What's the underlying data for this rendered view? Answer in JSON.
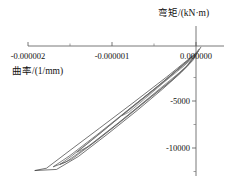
{
  "chart_data": {
    "type": "line",
    "title": "",
    "subtitle": "",
    "xlabel": "曲率/(1/mm)",
    "ylabel": "弯矩/(kN·m)",
    "xlim": [
      -2.3e-06,
      1.2e-07
    ],
    "ylim": [
      -12500,
      1200
    ],
    "grid": false,
    "legend": null,
    "xticks": [
      -2e-06,
      -1e-06,
      0.0
    ],
    "xticklabels": [
      "-0.000002",
      "-0.000001",
      "0.000000"
    ],
    "yticks": [
      -5000,
      -10000
    ],
    "yticklabels": [
      "-5000",
      "-10000"
    ],
    "annotations": [],
    "series": [
      {
        "name": "loop-1-outer",
        "color": "#3a3a3a",
        "points": [
          [
            4e-08,
            520
          ],
          [
            -2e-08,
            -60
          ],
          [
            -3.5e-07,
            -2450
          ],
          [
            -7.5e-07,
            -5200
          ],
          [
            -1.15e-06,
            -7900
          ],
          [
            -1.5e-06,
            -10250
          ],
          [
            -1.78e-06,
            -12150
          ],
          [
            -1.92e-06,
            -12400
          ],
          [
            -1.66e-06,
            -12280
          ],
          [
            -1.4e-06,
            -10900
          ],
          [
            -1.05e-06,
            -8500
          ],
          [
            -7e-07,
            -6000
          ],
          [
            -4e-07,
            -3750
          ],
          [
            -1.8e-07,
            -2000
          ],
          [
            -4e-08,
            -700
          ],
          [
            4e-08,
            520
          ]
        ]
      },
      {
        "name": "loop-2",
        "color": "#4a4a4a",
        "points": [
          [
            3e-08,
            350
          ],
          [
            -6e-08,
            -420
          ],
          [
            -3.8e-07,
            -2900
          ],
          [
            -7.8e-07,
            -5750
          ],
          [
            -1.18e-06,
            -8600
          ],
          [
            -1.5e-06,
            -10800
          ],
          [
            -1.7e-06,
            -12000
          ],
          [
            -1.55e-06,
            -11500
          ],
          [
            -1.25e-06,
            -9600
          ],
          [
            -9.2e-07,
            -7300
          ],
          [
            -6e-07,
            -5000
          ],
          [
            -3.2e-07,
            -3000
          ],
          [
            -1.2e-07,
            -1400
          ],
          [
            3e-08,
            350
          ]
        ]
      },
      {
        "name": "loop-3",
        "color": "#555555",
        "points": [
          [
            2e-08,
            260
          ],
          [
            -1e-07,
            -750
          ],
          [
            -4.5e-07,
            -3400
          ],
          [
            -8.5e-07,
            -6300
          ],
          [
            -1.2e-06,
            -8850
          ],
          [
            -1.48e-06,
            -10850
          ],
          [
            -1.62e-06,
            -11750
          ],
          [
            -1.48e-06,
            -11200
          ],
          [
            -1.18e-06,
            -9200
          ],
          [
            -8.6e-07,
            -6950
          ],
          [
            -5.5e-07,
            -4700
          ],
          [
            -2.8e-07,
            -2750
          ],
          [
            -1e-07,
            -1250
          ],
          [
            2e-08,
            260
          ]
        ]
      },
      {
        "name": "loop-4-inner",
        "color": "#666666",
        "points": [
          [
            1e-08,
            180
          ],
          [
            -1.4e-07,
            -1050
          ],
          [
            -4.8e-07,
            -3600
          ],
          [
            -8.2e-07,
            -6050
          ],
          [
            -1.1e-06,
            -8150
          ],
          [
            -1.32e-06,
            -9750
          ],
          [
            -1.42e-06,
            -10450
          ],
          [
            -1.28e-06,
            -9850
          ],
          [
            -1e-06,
            -7900
          ],
          [
            -7e-07,
            -5700
          ],
          [
            -4.2e-07,
            -3600
          ],
          [
            -2e-07,
            -2000
          ],
          [
            -6e-08,
            -850
          ],
          [
            1e-08,
            180
          ]
        ]
      },
      {
        "name": "loop-5-small",
        "color": "#707070",
        "points": [
          [
            0.0,
            60
          ],
          [
            -8e-08,
            -600
          ],
          [
            -3e-07,
            -2350
          ],
          [
            -5.5e-07,
            -4200
          ],
          [
            -7.6e-07,
            -5700
          ],
          [
            -8.8e-07,
            -6550
          ],
          [
            -8e-07,
            -6200
          ],
          [
            -6e-07,
            -4700
          ],
          [
            -3.8e-07,
            -3000
          ],
          [
            -1.8e-07,
            -1550
          ],
          [
            -5e-08,
            -520
          ],
          [
            0.0,
            60
          ]
        ]
      },
      {
        "name": "loop-6-tiny",
        "color": "#7a7a7a",
        "points": [
          [
            6e-08,
            760
          ],
          [
            1e-08,
            120
          ],
          [
            -1.2e-07,
            -900
          ],
          [
            -2.2e-07,
            -1700
          ],
          [
            -1.6e-07,
            -1350
          ],
          [
            -6e-08,
            -600
          ],
          [
            2e-08,
            200
          ],
          [
            6e-08,
            760
          ]
        ]
      }
    ]
  },
  "axes": {
    "x_axis_name": "x-axis-line",
    "y_axis_name": "y-axis-line"
  }
}
